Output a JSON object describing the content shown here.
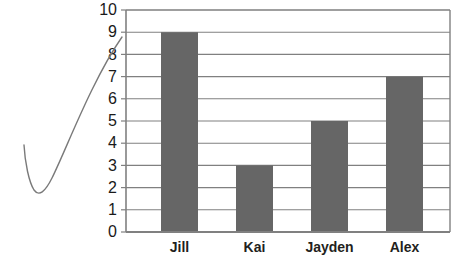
{
  "chart_data": {
    "type": "bar",
    "title": "",
    "subtitle": "",
    "xlabel": "",
    "ylabel": "",
    "categories": [
      "Jill",
      "Kai",
      "Jayden",
      "Alex"
    ],
    "values": [
      9,
      3,
      5,
      7
    ],
    "ylim": [
      0,
      10
    ],
    "ytick_labels": [
      "10",
      "9",
      "8",
      "7",
      "6",
      "5",
      "4",
      "3",
      "2",
      "1",
      "0"
    ],
    "ytick_values": [
      10,
      9,
      8,
      7,
      6,
      5,
      4,
      3,
      2,
      1,
      0
    ],
    "ytick_step": 1,
    "grid": "horizontal",
    "legend": "none",
    "annotations": [
      {
        "name": "swoosh-curve",
        "kind": "hand-drawn-check-mark",
        "description": "curved pen stroke sweeping from lower-left up to the 9 gridline"
      }
    ],
    "colors": {
      "bar_fill": "#666666",
      "plot_border": "#808080",
      "gridline": "#808080",
      "axis_text": "#1a1a1a",
      "category_text": "#231f20",
      "annotation_stroke": "#7a7a7a",
      "background": "#ffffff"
    }
  },
  "plot_geometry": {
    "left": 126,
    "right": 450,
    "top": 10,
    "bottom": 232,
    "bar_width": 37,
    "bar_centers": [
      179.5,
      254.5,
      329.5,
      404.5
    ],
    "category_label_y": 248
  }
}
